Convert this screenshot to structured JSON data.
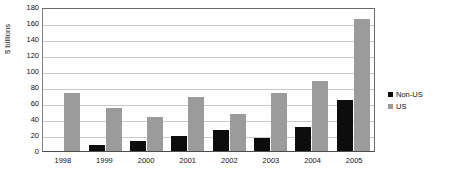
{
  "chart_data": {
    "type": "bar",
    "title": "",
    "subtitle": "",
    "xlabel": "",
    "ylabel": "$ billions",
    "categories": [
      "1998",
      "1999",
      "2000",
      "2001",
      "2002",
      "2003",
      "2004",
      "2005"
    ],
    "series": [
      {
        "name": "Non-US",
        "color": "#0d0d0d",
        "values": [
          0,
          8,
          12,
          19,
          26,
          16,
          30,
          64
        ]
      },
      {
        "name": "US",
        "color": "#9b9b9b",
        "values": [
          73,
          54,
          43,
          67,
          46,
          73,
          87,
          165
        ]
      }
    ],
    "ylim": [
      0,
      180
    ],
    "yticks": [
      180,
      160,
      140,
      120,
      100,
      80,
      60,
      40,
      20,
      0
    ],
    "ytick_labels": [
      "180",
      "160",
      "140",
      "120",
      "100",
      "80",
      "60",
      "40",
      "20",
      "0"
    ],
    "grid": true,
    "grid_axis": "y",
    "legend_position": "right",
    "legend": [
      {
        "label": "Non-US",
        "swatch": "black-square-icon",
        "color": "#0d0d0d"
      },
      {
        "label": "US",
        "swatch": "gray-square-icon",
        "color": "#9b9b9b"
      }
    ],
    "plot_border": true,
    "background_color": "#ffffff",
    "gridline_color": "#c9c9c9",
    "axis_color": "#4d4d4d"
  }
}
